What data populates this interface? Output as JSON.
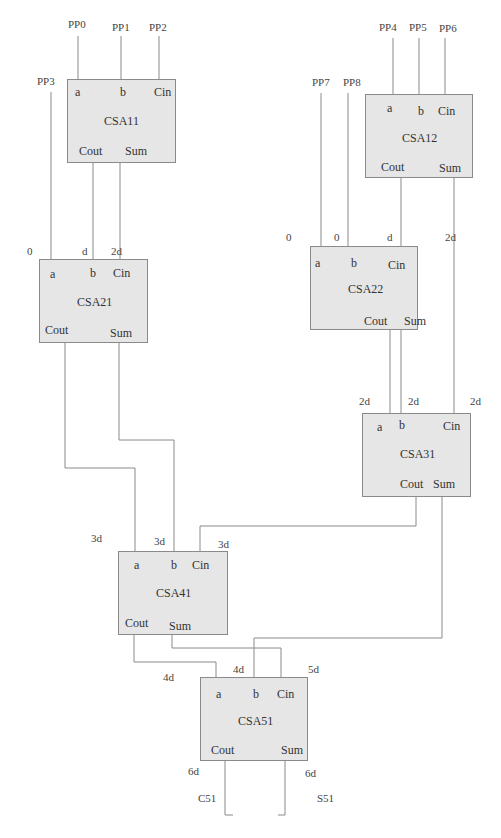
{
  "diagram": {
    "type": "carry-save adder tree",
    "blocks": [
      {
        "id": "CSA11",
        "name": "CSA11",
        "pins": {
          "a": "a",
          "b": "b",
          "cin": "Cin",
          "cout": "Cout",
          "sum": "Sum"
        }
      },
      {
        "id": "CSA12",
        "name": "CSA12",
        "pins": {
          "a": "a",
          "b": "b",
          "cin": "Cin",
          "cout": "Cout",
          "sum": "Sum"
        }
      },
      {
        "id": "CSA21",
        "name": "CSA21",
        "pins": {
          "a": "a",
          "b": "b",
          "cin": "Cin",
          "cout": "Cout",
          "sum": "Sum"
        }
      },
      {
        "id": "CSA22",
        "name": "CSA22",
        "pins": {
          "a": "a",
          "b": "b",
          "cin": "Cin",
          "cout": "Cout",
          "sum": "Sum"
        }
      },
      {
        "id": "CSA31",
        "name": "CSA31",
        "pins": {
          "a": "a",
          "b": "b",
          "cin": "Cin",
          "cout": "Cout",
          "sum": "Sum"
        }
      },
      {
        "id": "CSA41",
        "name": "CSA41",
        "pins": {
          "a": "a",
          "b": "b",
          "cin": "Cin",
          "cout": "Cout",
          "sum": "Sum"
        }
      },
      {
        "id": "CSA51",
        "name": "CSA51",
        "pins": {
          "a": "a",
          "b": "b",
          "cin": "Cin",
          "cout": "Cout",
          "sum": "Sum"
        }
      }
    ],
    "inputs": [
      "PP0",
      "PP1",
      "PP2",
      "PP3",
      "PP4",
      "PP5",
      "PP6",
      "PP7",
      "PP8"
    ],
    "outputs": [
      "C51",
      "S51"
    ],
    "delay_labels": {
      "csa21": [
        "0",
        "d",
        "2d"
      ],
      "csa22": [
        "0",
        "0",
        "d",
        "2d"
      ],
      "csa31": [
        "2d",
        "2d",
        "2d"
      ],
      "csa41": [
        "3d",
        "3d",
        "3d"
      ],
      "csa51_in": [
        "4d",
        "4d",
        "5d"
      ],
      "csa51_out": [
        "6d",
        "6d"
      ]
    }
  }
}
